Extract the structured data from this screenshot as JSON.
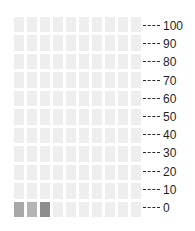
{
  "chart_data": {
    "type": "waffle",
    "title": "",
    "subtitle": "",
    "xlabel": "",
    "ylabel": "",
    "grid": {
      "columns": 10,
      "rows": 11,
      "total_cells": 110,
      "fill_order": "bottom-left-to-right"
    },
    "axis": {
      "position": "right",
      "ylim": [
        0,
        100
      ],
      "tick_step": 10,
      "tick_style": "dashed",
      "tick_labels": [
        "100",
        "90",
        "80",
        "70",
        "60",
        "50",
        "40",
        "30",
        "20",
        "10",
        "0"
      ],
      "tick_values": [
        100,
        90,
        80,
        70,
        60,
        50,
        40,
        30,
        20,
        10,
        0
      ]
    },
    "legend": {
      "visible": false
    },
    "categories": [
      "filled-1",
      "filled-2",
      "filled-3"
    ],
    "values": [
      1,
      1,
      1
    ],
    "filled_count": 3,
    "empty_count": 107,
    "cells": [
      {
        "row": 10,
        "col": 0,
        "value": 1,
        "color": "#a8a8a8"
      },
      {
        "row": 10,
        "col": 1,
        "value": 1,
        "color": "#b5b5b5"
      },
      {
        "row": 10,
        "col": 2,
        "value": 1,
        "color": "#8e8e8e"
      }
    ]
  },
  "colors": {
    "background": "#ffffff",
    "empty_cell": "#eeeeee",
    "filled_cell_1": "#a8a8a8",
    "filled_cell_2": "#b5b5b5",
    "filled_cell_3": "#8e8e8e",
    "tick_line": "#2b2b2b",
    "tick_text": "#1f1f1f"
  }
}
